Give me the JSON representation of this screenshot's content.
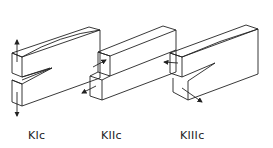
{
  "diagram": {
    "stroke_color": "#222222",
    "background": "#ffffff",
    "modes": [
      {
        "id": "mode-1",
        "label": "KIc",
        "description": "Opening mode (tensile)"
      },
      {
        "id": "mode-2",
        "label": "KIIc",
        "description": "Sliding mode (in-plane shear)"
      },
      {
        "id": "mode-3",
        "label": "KIIIc",
        "description": "Tearing mode (out-of-plane shear)"
      }
    ]
  }
}
